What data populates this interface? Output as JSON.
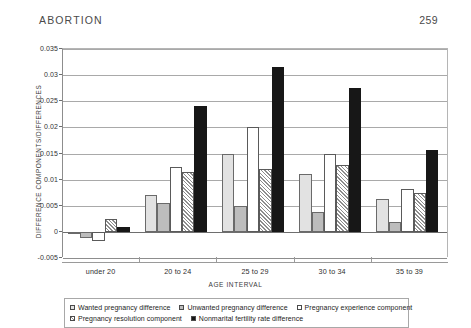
{
  "running_head": {
    "title": "ABORTION",
    "page_number": "259"
  },
  "chart_data": {
    "type": "bar",
    "title": "",
    "xlabel": "AGE INTERVAL",
    "ylabel": "DIFFERENCE COMPONENTS/DIFFERENCES",
    "categories": [
      "under 20",
      "20 to 24",
      "25 to 29",
      "30 to 34",
      "35 to 39"
    ],
    "ylim": [
      -0.005,
      0.035
    ],
    "ytick_labels": [
      "0.035",
      "0.03",
      "0.025",
      "0.02",
      "0.015",
      "0.01",
      "0.005",
      "0",
      "-0.005"
    ],
    "ytick_values": [
      0.035,
      0.03,
      0.025,
      0.02,
      0.015,
      0.01,
      0.005,
      0,
      -0.005
    ],
    "grid": true,
    "legend_position": "bottom",
    "series": [
      {
        "name": "Wanted pregnancy difference",
        "swatch": "s1",
        "color": "#e2e2e2",
        "values": [
          -0.0002,
          0.007,
          0.015,
          0.011,
          0.0063
        ]
      },
      {
        "name": "Unwanted pregnancy difference",
        "swatch": "s2",
        "color": "#bdbdbd",
        "values": [
          -0.0012,
          0.0055,
          0.005,
          0.0038,
          0.0018
        ]
      },
      {
        "name": "Pregnancy experience component",
        "swatch": "s3",
        "color": "#ffffff",
        "values": [
          -0.0017,
          0.0125,
          0.02,
          0.015,
          0.0083
        ]
      },
      {
        "name": "Pregnancy resolution component",
        "swatch": "s4",
        "color": "#ffffff-hatch",
        "values": [
          0.0025,
          0.0115,
          0.012,
          0.0128,
          0.0075
        ]
      },
      {
        "name": "Nonmarital fertility rate difference",
        "swatch": "s5",
        "color": "#171717",
        "values": [
          0.001,
          0.024,
          0.0315,
          0.0275,
          0.0157
        ]
      }
    ]
  }
}
